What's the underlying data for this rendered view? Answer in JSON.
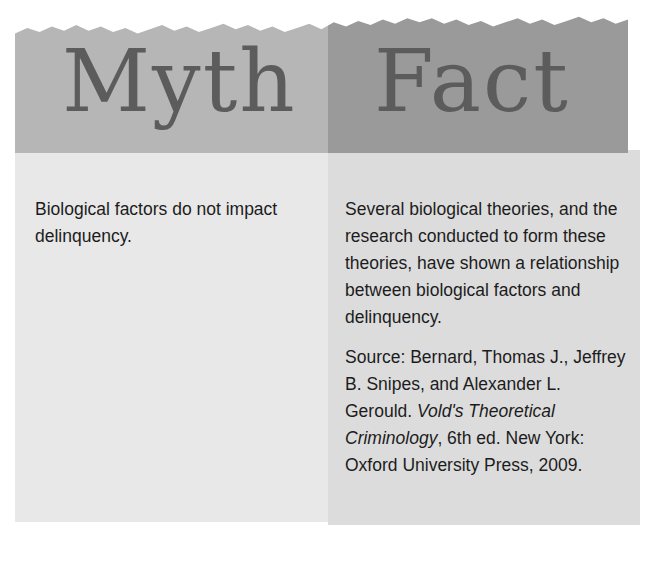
{
  "figure": {
    "type": "myth-fact-callout-box",
    "columns": [
      {
        "id": "myth",
        "heading": "Myth",
        "body": "Biological factors do not impact delinquency.",
        "band_color": "#b6b6b6",
        "panel_color": "#e8e8e8"
      },
      {
        "id": "fact",
        "heading": "Fact",
        "body": "Several biological theories, and the research conducted to form these theories, have shown a relationship between biological factors and delinquency.",
        "band_color": "#9a9a9a",
        "panel_color": "#dcdcdc",
        "source": {
          "label": "Source:",
          "authors": "Bernard, Thomas J., Jeffrey B. Snipes, and Alexander L. Gerould.",
          "book_title": "Vold's Theoretical Criminology",
          "publication": ", 6th ed. New York: Oxford University Press, 2009."
        }
      }
    ],
    "heading_color": "#5c5c5c",
    "text_color": "#1c1c1c"
  }
}
